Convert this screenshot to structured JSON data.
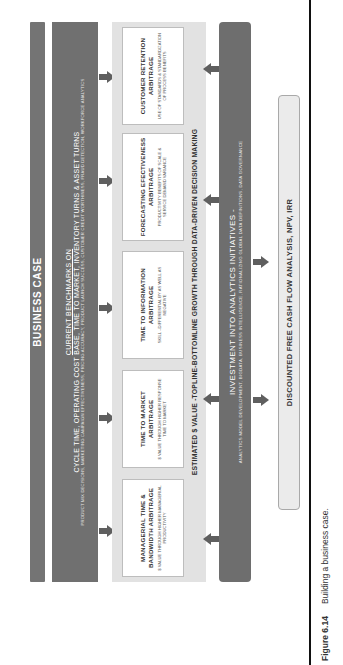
{
  "figure": {
    "orientation": "rotated-90-ccw",
    "title_band": {
      "label": "BUSINESS CASE"
    },
    "benchmarks_band": {
      "heading": "CURRENT BENCHMARKS ON",
      "line1": "CYCLE TIME, OPERATING COST BASE, TIME TO MARKET, INVENTORY TURNS & ASSET TURNS",
      "line2": "PRODUCT MIX DECISIONS, MARKETING CAMPAIGN EFFECTIVENESS, PRICING ACCURACY, PRODUCT LAUNCH SUCCESS, CUSTOMER CREDIT WORTHINESS, FRAUD DETECTION, WORKFORCE ANALYTICS"
    },
    "arbitrage_boxes": [
      {
        "title": "MANAGERIAL TIME & BANDWIDTH ARBITRAGE",
        "subtitle": "$ VALUE THROUGH HIGHER MANAGERIAL PRODUCTIVITY"
      },
      {
        "title": "TIME TO MARKET ARBITRAGE",
        "subtitle": "$ VALUE THROUGH HIGHER RESPONSE TIME TO MARKET"
      },
      {
        "title": "TIME TO INFORMATION ARBITRAGE",
        "subtitle": "SKILL –DIFFERENTIAL BY AS WELL AS NEGATIVE"
      },
      {
        "title": "FORECASTING EFECTIVENESS ARBITRAGE",
        "subtitle": "PRODUCTIVITY BENEFITS OF SCALE & SERVICE DEMAND VARIANCE"
      },
      {
        "title": "CUSTOMER RETENTION ARBITRAGE",
        "subtitle": "USE OF STANDARDS & STANDARDIZATION OF PROCESS BENEFITS"
      }
    ],
    "estimated_value": {
      "label": "ESTIMATED $ VALUE -TOPLINE-BOTTOMLINE GROWTH THROUGH DATA-DRIVEN DECISION MAKING"
    },
    "investment_band": {
      "heading": "INVESTMENT INTO ANALYTICS INITIATIVES -",
      "detail": "ANALYTICS MODEL DEVELOPMENT, BIGDATA, BUSINESS INTELLIGENCE, RATIONALIZING GLOBAL DATA DEFINITIONS, DATA GOVERNANCE"
    },
    "dcf_box": {
      "label": "DISCOUNTED FREE CASH FLOW ANALYSIS, NPV, IRR"
    },
    "caption": {
      "number": "Figure 6.14",
      "text": "Building a business case."
    },
    "colors": {
      "dark_band": "#6e6e6e",
      "panel": "#e2e2e2",
      "box": "#ffffff",
      "dcf_fill": "#ebebeb",
      "arrow": "#5f5f5f",
      "rule": "#111111"
    },
    "icons": {
      "down_arrow": "arrow-down-icon",
      "up_arrow": "arrow-up-icon"
    }
  }
}
